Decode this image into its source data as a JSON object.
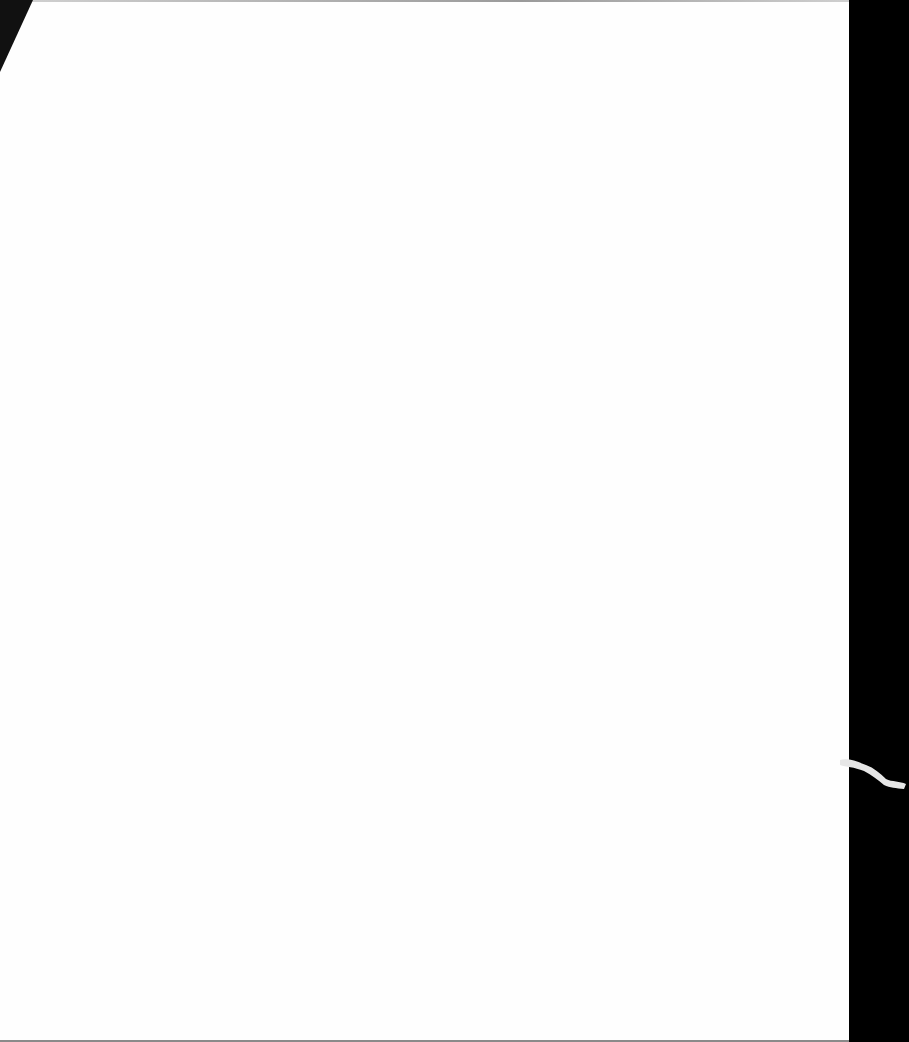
{
  "document": {
    "type": "scanned blank page",
    "text": "",
    "colors": {
      "paper": "#fefefe",
      "background": "#000000",
      "edge_shadow": "#8a8a8a"
    }
  }
}
